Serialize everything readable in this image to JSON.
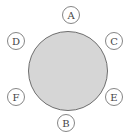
{
  "diagram": {
    "type": "round-table-seating",
    "table": {
      "cx": 68,
      "cy": 71,
      "r": 39.5,
      "fill": "#d6d6d6",
      "stroke": "#6e6e6e"
    },
    "seats": [
      {
        "label": "A",
        "cx": 71,
        "cy": 15
      },
      {
        "label": "D",
        "cx": 16,
        "cy": 41
      },
      {
        "label": "C",
        "cx": 114,
        "cy": 41
      },
      {
        "label": "F",
        "cx": 16,
        "cy": 97
      },
      {
        "label": "E",
        "cx": 114,
        "cy": 97
      },
      {
        "label": "B",
        "cx": 66,
        "cy": 123
      }
    ],
    "seat_radius": 8.5,
    "seat_stroke": "#777777"
  }
}
